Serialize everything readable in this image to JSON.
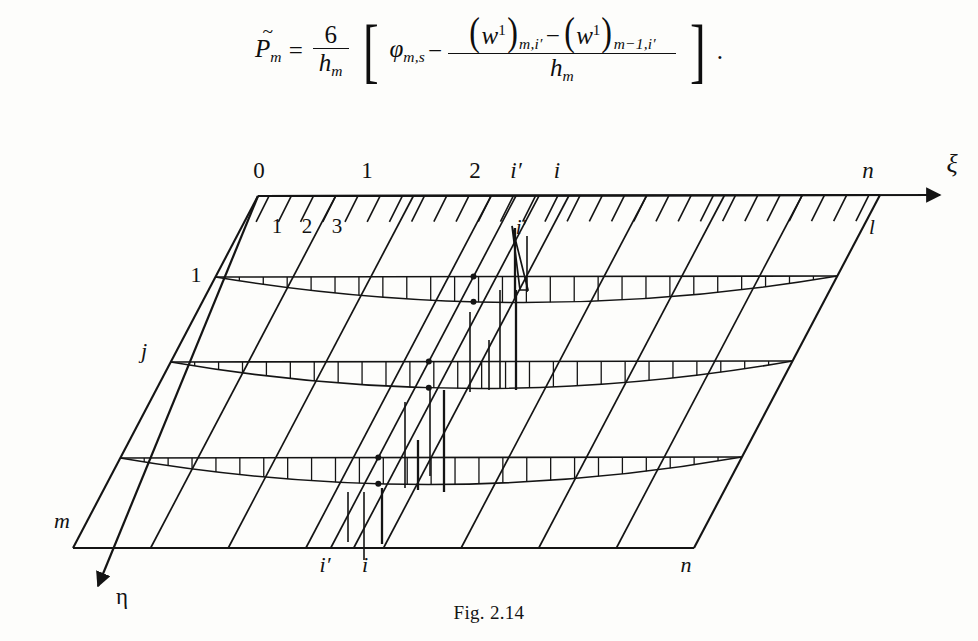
{
  "page": {
    "background": "#fdfdfb",
    "ink": "#121212"
  },
  "equation": {
    "lhs_symbol": "P",
    "lhs_accent": "~",
    "lhs_sub": "m",
    "equals": "=",
    "factor_num": "6",
    "factor_den_symbol": "h",
    "factor_den_sub": "m",
    "bracket_open": "[",
    "bracket_close": "]",
    "phi": "φ",
    "phi_sub": "m,s",
    "minus": "−",
    "w_symbol": "w",
    "w_sup": "1",
    "w_sub_first": "m,i′",
    "w_sub_second": "m−1,i′",
    "paren_open": "(",
    "paren_close": ")",
    "den_symbol": "h",
    "den_sub": "m",
    "terminator": "."
  },
  "figure": {
    "caption": "Fig. 2.14",
    "axes": {
      "xi_label": "ξ",
      "eta_label": "η"
    },
    "top_labels": [
      {
        "text": "0",
        "x": 259,
        "y": 38
      },
      {
        "text": "1",
        "x": 367,
        "y": 38
      },
      {
        "text": "2",
        "x": 475,
        "y": 38
      },
      {
        "text": "i′",
        "x": 516,
        "y": 38
      },
      {
        "text": "i",
        "x": 557,
        "y": 38
      },
      {
        "text": "n",
        "x": 868,
        "y": 38
      }
    ],
    "inner_top_labels": [
      {
        "text": "1",
        "x": 277,
        "y": 93
      },
      {
        "text": "2",
        "x": 307,
        "y": 93
      },
      {
        "text": "3",
        "x": 337,
        "y": 93
      },
      {
        "text": "i′",
        "x": 521,
        "y": 94
      },
      {
        "text": "l",
        "x": 872,
        "y": 94
      }
    ],
    "left_labels": [
      {
        "text": "1",
        "x": 196,
        "y": 142
      },
      {
        "text": "j",
        "x": 144,
        "y": 218
      },
      {
        "text": "m",
        "x": 62,
        "y": 388
      }
    ],
    "bottom_labels": [
      {
        "text": "i′",
        "x": 325,
        "y": 432
      },
      {
        "text": "i",
        "x": 365,
        "y": 432
      },
      {
        "text": "n",
        "x": 686,
        "y": 432
      }
    ],
    "grid": {
      "corners": {
        "top_left": [
          258,
          56
        ],
        "top_right": [
          880,
          55
        ],
        "bottom_right": [
          694,
          408
        ],
        "bottom_left": [
          73,
          408
        ]
      },
      "column_count": 8,
      "row_count": 4,
      "hatch_count": 28,
      "band_count": 3
    },
    "bands": [
      {
        "name": "load-band-row-1",
        "y_left": 137,
        "y_right": 136,
        "bulge": 26,
        "segments": 26
      },
      {
        "name": "load-band-row-2",
        "y_left": 222,
        "y_right": 221,
        "bulge": 27,
        "segments": 26
      },
      {
        "name": "load-band-row-3",
        "y_left": 318,
        "y_right": 317,
        "bulge": 27,
        "segments": 26
      }
    ]
  }
}
